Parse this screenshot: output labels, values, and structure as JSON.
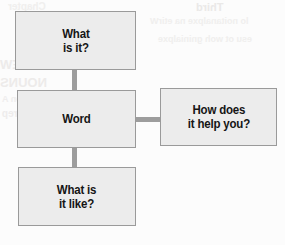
{
  "diagram": {
    "type": "concept-map",
    "style": {
      "box_fill": "#ececec",
      "box_border": "#9a9a9a",
      "connector_color": "#9d9d9d",
      "text_color": "#151515",
      "page_background": "#fcfcfc"
    },
    "nodes": [
      {
        "id": "what-is-it",
        "label": "What\nis it?",
        "x": 15,
        "y": 11,
        "width": 121,
        "height": 59
      },
      {
        "id": "word",
        "label": "Word",
        "x": 17,
        "y": 90,
        "width": 119,
        "height": 58
      },
      {
        "id": "how-does-it-help-you",
        "label": "How does\nit help you?",
        "x": 160,
        "y": 88,
        "width": 117,
        "height": 58
      },
      {
        "id": "what-is-it-like",
        "label": "What is\nit like?",
        "x": 18,
        "y": 167,
        "width": 118,
        "height": 59
      }
    ],
    "connectors": [
      {
        "id": "word-to-what-is-it",
        "from": "word",
        "to": "what-is-it",
        "orientation": "vertical",
        "x": 72,
        "y": 70,
        "length": 20,
        "thickness": 5
      },
      {
        "id": "word-to-what-is-it-like",
        "from": "word",
        "to": "what-is-it-like",
        "orientation": "vertical",
        "x": 72,
        "y": 148,
        "length": 19,
        "thickness": 5
      },
      {
        "id": "word-to-how-does-it-help-you",
        "from": "word",
        "to": "how-does-it-help-you",
        "orientation": "horizontal",
        "x": 136,
        "y": 117,
        "length": 24,
        "thickness": 5
      }
    ]
  },
  "background_bleed_text": {
    "note": "faint mirrored show-through from the reverse side of the scanned page",
    "lines": [
      "Third",
      "lo noitanalpxe na etirW",
      "esu ot woh gninialpxe",
      "REVIEW",
      "NOUNS",
      "eman a si nuon A",
      "ro ecalp ,nosrep",
      "Chapter"
    ]
  }
}
